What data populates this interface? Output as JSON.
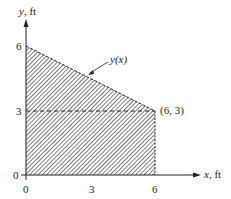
{
  "diagram": {
    "type": "shaded-region-plot",
    "y_axis": {
      "label_var": "y",
      "label_unit": ", ft",
      "ticks": [
        "0",
        "3",
        "6"
      ]
    },
    "x_axis": {
      "label_var": "x",
      "label_unit": ", ft",
      "ticks": [
        "0",
        "3",
        "6"
      ]
    },
    "curve_label": "y(x)",
    "point_label": "(6, 3)",
    "region": {
      "vertices": [
        [
          0,
          0
        ],
        [
          0,
          6
        ],
        [
          6,
          3
        ],
        [
          6,
          0
        ]
      ],
      "fill": "diagonal-hatch",
      "dashed_line_y": 3
    },
    "colors": {
      "line": "#222222",
      "hatch": "#555555",
      "background": "#ffffff"
    }
  }
}
